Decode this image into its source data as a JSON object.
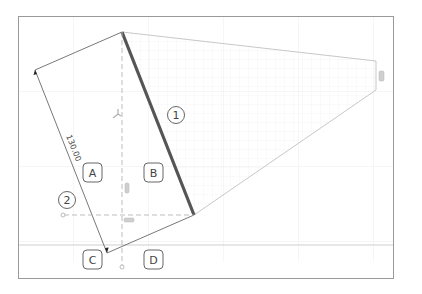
{
  "diagram": {
    "dimension_value": "130.00",
    "callouts": [
      {
        "id": "1",
        "label": "1"
      },
      {
        "id": "2",
        "label": "2"
      }
    ],
    "region_labels": [
      {
        "id": "A",
        "label": "A"
      },
      {
        "id": "B",
        "label": "B"
      },
      {
        "id": "C",
        "label": "C"
      },
      {
        "id": "D",
        "label": "D"
      }
    ],
    "colors": {
      "frame": "#9a9a9a",
      "grid": "#ececec",
      "shape_outline": "#c8c8c8",
      "highlight_edge": "#555555",
      "construction_line": "#b5b5b5",
      "dimension_line": "#555555",
      "handle_fill": "#cfcfcf"
    }
  }
}
